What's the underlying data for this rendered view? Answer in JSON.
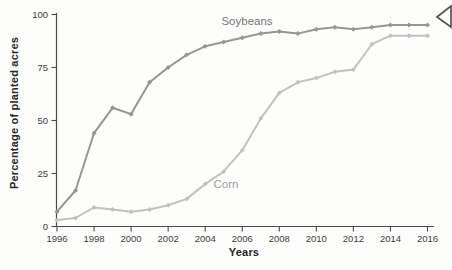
{
  "figure": {
    "background": "#fdfdfc",
    "axis_color": "#4a4a4a",
    "tick_text_color": "#3c3c3c"
  },
  "chart_data": {
    "type": "line",
    "title": "",
    "xlabel": "Years",
    "ylabel": "Percentage of planted acres",
    "x": [
      1996,
      1997,
      1998,
      1999,
      2000,
      2001,
      2002,
      2003,
      2004,
      2005,
      2006,
      2007,
      2008,
      2009,
      2010,
      2011,
      2012,
      2013,
      2014,
      2015,
      2016
    ],
    "x_ticks": [
      1996,
      1998,
      2000,
      2002,
      2004,
      2006,
      2008,
      2010,
      2012,
      2014,
      2016
    ],
    "y_ticks": [
      0,
      25,
      50,
      75,
      100
    ],
    "xlim": [
      1996,
      2016
    ],
    "ylim": [
      0,
      100
    ],
    "grid": false,
    "legend": "inline-labels",
    "series": [
      {
        "name": "Soybeans",
        "color": "#969696",
        "label_color": "#757575",
        "values": [
          7,
          17,
          44,
          56,
          53,
          68,
          75,
          81,
          85,
          87,
          89,
          91,
          92,
          91,
          93,
          94,
          93,
          94,
          95,
          95,
          95
        ]
      },
      {
        "name": "Corn",
        "color": "#c2c2c2",
        "label_color": "#9e9e9e",
        "values": [
          3,
          4,
          9,
          8,
          7,
          8,
          10,
          13,
          20,
          26,
          36,
          51,
          63,
          68,
          70,
          73,
          74,
          86,
          90,
          90,
          90
        ]
      }
    ]
  },
  "icons": {
    "corner_arrow": "left-pointing-triangle-outline",
    "corner_arrow_color": "#555555"
  }
}
